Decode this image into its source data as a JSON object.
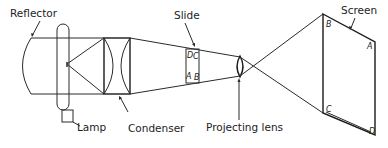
{
  "diagram": {
    "type": "optical projector schematic",
    "labels": {
      "reflector": "Reflector",
      "lamp": "Lamp",
      "condenser": "Condenser",
      "slide": "Slide",
      "projecting_lens": "Projecting lens",
      "screen": "Screen"
    },
    "slide_points": {
      "top_left": "D",
      "top_right": "C",
      "bottom_left": "A",
      "bottom_right": "B"
    },
    "screen_points": {
      "top_left": "B",
      "top_right": "A",
      "bottom_left": "C",
      "bottom_right": "D"
    },
    "colors": {
      "line": "#2a2a2a",
      "background": "#ffffff"
    }
  }
}
